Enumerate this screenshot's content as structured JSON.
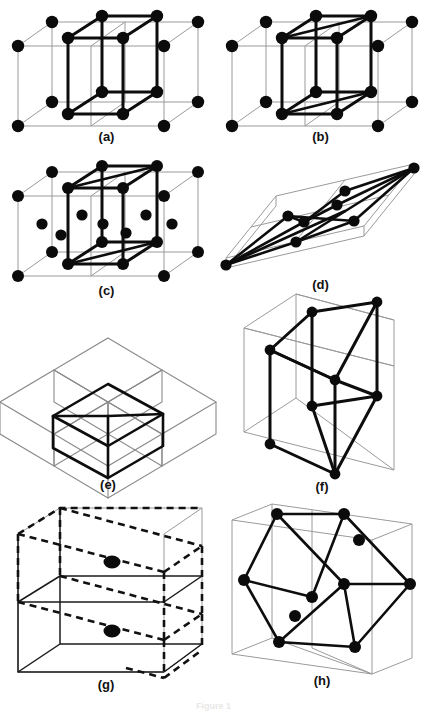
{
  "figure": {
    "kind": "crystal-lattice-unit-cells",
    "background_color": "#ffffff",
    "atom_color": "#0b0b0b",
    "bold_edge_color": "#0d0d0d",
    "thin_edge_color": "#9a9a9a",
    "dashed_edge_color": "#111111",
    "panel_count": 8,
    "bottom_caption": "Figure 1"
  },
  "panels": [
    {
      "id": "a",
      "label": "(a)",
      "description": "Simple tetragonal cell outlined in bold inside a larger thin lattice block",
      "lattice_type": "simple tetragonal",
      "atom_count": 14,
      "bold_cell_atoms": 8,
      "interior_atoms": 0,
      "edge_style": "solid"
    },
    {
      "id": "b",
      "label": "(b)",
      "description": "Body-centered tetragonal cell outlined in bold inside a thin lattice block",
      "lattice_type": "body-centered tetragonal",
      "atom_count": 14,
      "bold_cell_atoms": 8,
      "interior_atoms": 0,
      "edge_style": "solid"
    },
    {
      "id": "c",
      "label": "(c)",
      "description": "Tetragonal block with bold inner cell and additional face / interior atoms",
      "lattice_type": "centered tetragonal",
      "atom_count": 20,
      "bold_cell_atoms": 8,
      "interior_atoms": 6,
      "edge_style": "solid"
    },
    {
      "id": "d",
      "label": "(d)",
      "description": "Flattened rhombohedral slab with bold diagonal bonds from the two far corners",
      "lattice_type": "rhombohedral",
      "atom_count": 8,
      "bold_cell_atoms": 8,
      "interior_atoms": 0,
      "edge_style": "solid"
    },
    {
      "id": "e",
      "label": "(e)",
      "description": "Bold primitive cell drawn among four thin outline cubes, no atoms shown",
      "lattice_type": "primitive cell in cubic array",
      "atom_count": 0,
      "bold_cell_atoms": 0,
      "interior_atoms": 0,
      "edge_style": "solid"
    },
    {
      "id": "f",
      "label": "(f)",
      "description": "Bold cube set at an angle inside a thin outer parallelepiped, atoms at cube corners",
      "lattice_type": "cubic cell in larger cell",
      "atom_count": 8,
      "bold_cell_atoms": 8,
      "interior_atoms": 0,
      "edge_style": "solid"
    },
    {
      "id": "g",
      "label": "(g)",
      "description": "Thin outer box with a dashed inclined cell and two interior atoms",
      "lattice_type": "base-centered / inclined cell",
      "atom_count": 2,
      "bold_cell_atoms": 0,
      "interior_atoms": 2,
      "edge_style": "dashed"
    },
    {
      "id": "h",
      "label": "(h)",
      "description": "Bold tilted cell with atoms inside a thin outer parallelepiped",
      "lattice_type": "tilted cell in larger cell",
      "atom_count": 10,
      "bold_cell_atoms": 8,
      "interior_atoms": 2,
      "edge_style": "solid"
    }
  ]
}
